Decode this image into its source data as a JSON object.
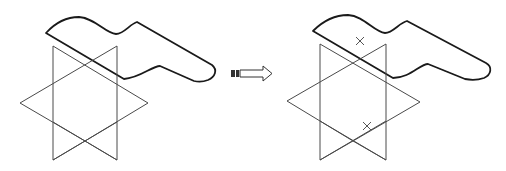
{
  "figure": {
    "panels": [
      {
        "name": "before",
        "elements": [
          "swept-surface",
          "star-sketch"
        ]
      },
      {
        "name": "after",
        "elements": [
          "swept-surface",
          "star-sketch",
          "point-marks"
        ]
      }
    ],
    "arrow": {
      "direction": "right"
    },
    "marks": [
      {
        "symbol": "×",
        "x": 360,
        "y": 41
      },
      {
        "symbol": "×",
        "x": 367,
        "y": 126
      }
    ],
    "colors": {
      "surface_light": "#f2f2f2",
      "surface_dark": "#8a8a8a",
      "edge": "#1a1a1a",
      "wire": "#4a4a4a"
    }
  }
}
